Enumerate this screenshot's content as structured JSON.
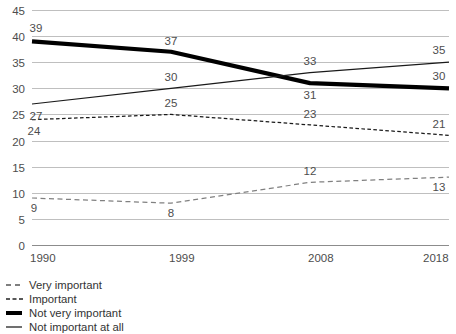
{
  "chart_data": {
    "type": "line",
    "title": "",
    "subtitle": "",
    "xlabel": "",
    "ylabel": "",
    "categories": [
      "1990",
      "1999",
      "2008",
      "2018"
    ],
    "x": [
      1990,
      1999,
      2008,
      2018
    ],
    "ylim": [
      0,
      45
    ],
    "yticks": [
      0,
      5,
      10,
      15,
      20,
      25,
      30,
      35,
      40,
      45
    ],
    "ytick_labels": [
      "0",
      "5",
      "10",
      "15",
      "20",
      "25",
      "30",
      "35",
      "40",
      "45"
    ],
    "xtick_labels": [
      "1990",
      "1999",
      "2008",
      "2018"
    ],
    "grid": true,
    "legend_position": "below-left",
    "series": [
      {
        "name": "Very important",
        "style": "dashed-wide",
        "color": "#808080",
        "values": [
          9,
          8,
          12,
          13
        ],
        "labels": [
          "9",
          "8",
          "12",
          "13"
        ]
      },
      {
        "name": "Important",
        "style": "dashed-tight",
        "color": "#1a1a1a",
        "values": [
          24,
          25,
          23,
          21
        ],
        "labels": [
          "24",
          "25",
          "23",
          "21"
        ]
      },
      {
        "name": "Not very important",
        "style": "solid-thick",
        "color": "#000000",
        "values": [
          39,
          37,
          31,
          30
        ],
        "labels": [
          "39",
          "37",
          "31",
          "30"
        ]
      },
      {
        "name": "Not important at all",
        "style": "solid-thin",
        "color": "#1a1a1a",
        "values": [
          27,
          30,
          33,
          35
        ],
        "labels": [
          "27",
          "30",
          "33",
          "35"
        ]
      }
    ]
  },
  "legend": {
    "items": [
      {
        "label": "Very important"
      },
      {
        "label": "Important"
      },
      {
        "label": "Not very important"
      },
      {
        "label": "Not important at all"
      }
    ]
  },
  "axes": {
    "y_labels": [
      "45",
      "40",
      "35",
      "30",
      "25",
      "20",
      "15",
      "10",
      "5",
      "0"
    ],
    "x_labels": [
      "1990",
      "1999",
      "2008",
      "2018"
    ]
  }
}
